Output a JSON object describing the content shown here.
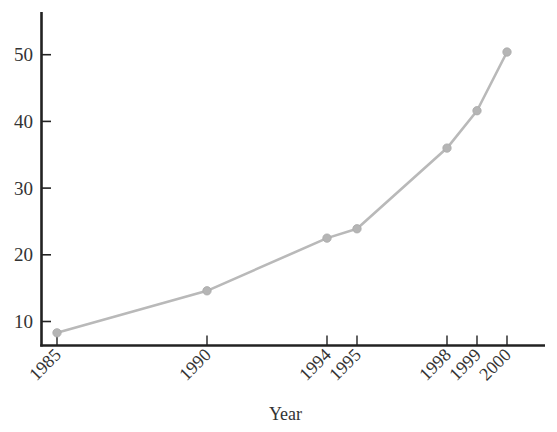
{
  "chart_data": {
    "type": "line",
    "title": "",
    "xlabel": "Year",
    "ylabel": "",
    "x": [
      1985,
      1990,
      1994,
      1995,
      1998,
      1999,
      2000
    ],
    "categories": [
      "1985",
      "1990",
      "1994",
      "1995",
      "1998",
      "1999",
      "2000"
    ],
    "series": [
      {
        "name": "",
        "values": [
          8.3,
          14.6,
          22.5,
          23.9,
          36.0,
          41.6,
          50.4
        ],
        "color": "#b9b9b9",
        "marker": "circle"
      }
    ],
    "y_ticks": [
      10,
      20,
      30,
      40,
      50
    ],
    "x_ticks": [
      1985,
      1990,
      1994,
      1995,
      1998,
      1999,
      2000
    ],
    "xlim": [
      1984.5,
      2001.3
    ],
    "ylim": [
      6.5,
      52.6
    ],
    "grid": false,
    "legend": null
  },
  "axes": {
    "x_title": "Year",
    "y_tick_labels": [
      "10",
      "20",
      "30",
      "40",
      "50"
    ],
    "x_tick_labels": [
      "1985",
      "1990",
      "1994",
      "1995",
      "1998",
      "1999",
      "2000"
    ]
  },
  "colors": {
    "axis": "#222222",
    "line": "#b9b9b9",
    "marker": "#b5b5b5",
    "text": "#333333"
  }
}
